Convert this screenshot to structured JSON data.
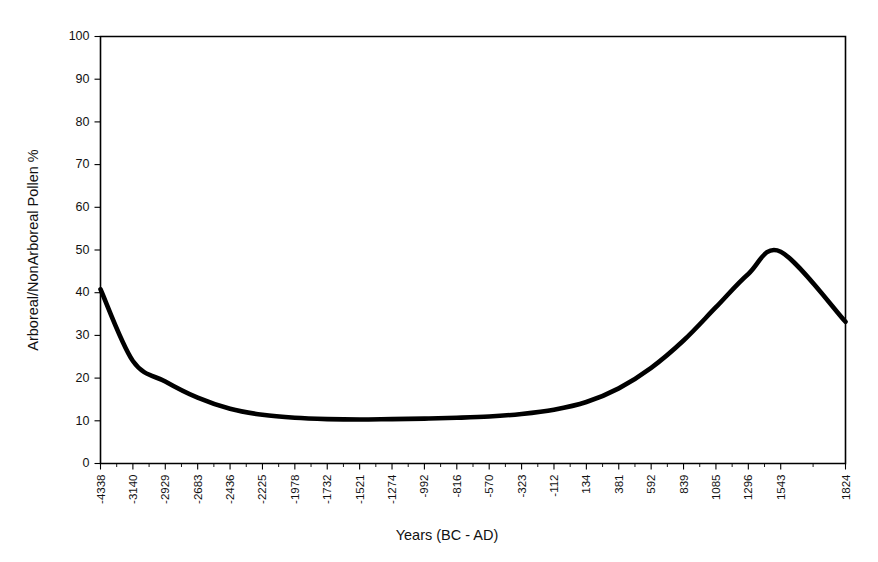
{
  "chart_data": {
    "type": "line",
    "title": "",
    "xlabel": "Years (BC - AD)",
    "ylabel": "Arboreal/NonArboreal Pollen %",
    "grid": false,
    "legend": false,
    "ylim": [
      0,
      100
    ],
    "ytick_labels": [
      "0",
      "10",
      "20",
      "30",
      "40",
      "50",
      "60",
      "70",
      "80",
      "90",
      "100"
    ],
    "ytick_values": [
      0,
      10,
      20,
      30,
      40,
      50,
      60,
      70,
      80,
      90,
      100
    ],
    "xtick_labels": [
      "-4338",
      "-3140",
      "-2929",
      "-2683",
      "-2436",
      "-2225",
      "-1978",
      "-1732",
      "-1521",
      "-1274",
      "-992",
      "-816",
      "-570",
      "-323",
      "-112",
      "134",
      "381",
      "592",
      "839",
      "1085",
      "1296",
      "1543",
      "1824"
    ],
    "categories": [
      "-4338",
      "-3140",
      "-2929",
      "-2683",
      "-2436",
      "-2225",
      "-1978",
      "-1732",
      "-1521",
      "-1274",
      "-992",
      "-816",
      "-570",
      "-323",
      "-112",
      "134",
      "381",
      "592",
      "839",
      "1085",
      "1296",
      "1543",
      "1824"
    ],
    "values": [
      40.8,
      24.0,
      19.2,
      15.4,
      12.8,
      11.4,
      10.7,
      10.4,
      10.3,
      10.4,
      10.5,
      10.7,
      11.0,
      11.6,
      12.6,
      14.4,
      17.6,
      22.4,
      28.8,
      36.6,
      44.4,
      49.6,
      33.2
    ],
    "series": [
      {
        "name": "Arboreal/NonArboreal Pollen %",
        "values": [
          40.8,
          24.0,
          19.2,
          15.4,
          12.8,
          11.4,
          10.7,
          10.4,
          10.3,
          10.4,
          10.5,
          10.7,
          11.0,
          11.6,
          12.6,
          14.4,
          17.6,
          22.4,
          28.8,
          36.6,
          44.4,
          49.6,
          33.2
        ],
        "color": "#000000"
      }
    ],
    "annotations": []
  },
  "colors": {
    "line": "#000000",
    "axis": "#000000",
    "background": "#ffffff",
    "text": "#111111"
  }
}
